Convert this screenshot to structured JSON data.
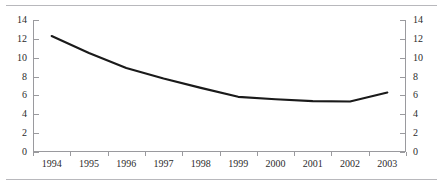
{
  "chart_data": {
    "type": "line",
    "title": "",
    "subtitle": "",
    "xlabel": "",
    "ylabel": "",
    "categories": [
      "1994",
      "1995",
      "1996",
      "1997",
      "1998",
      "1999",
      "2000",
      "2001",
      "2002",
      "2003"
    ],
    "series": [
      {
        "name": "",
        "values": [
          12.3,
          10.5,
          8.9,
          7.8,
          6.8,
          5.85,
          5.6,
          5.4,
          5.35,
          6.3
        ],
        "color": "#1a1a1a",
        "line_width": 2.1
      }
    ],
    "ylim": [
      0,
      14
    ],
    "ytick_step": 2,
    "yticks": [
      0,
      2,
      4,
      6,
      8,
      10,
      12,
      14
    ],
    "ytick_labels_left": [
      "0",
      "2",
      "4",
      "6",
      "8",
      "10",
      "12",
      "14"
    ],
    "ytick_labels_right": [
      "0",
      "2",
      "4",
      "6",
      "8",
      "10",
      "12",
      "14"
    ],
    "dual_axis": true,
    "grid": false,
    "legend": null,
    "legend_position": "none",
    "annotations": [],
    "axis_color": "#9a9a9e",
    "text_color": "#2b2b2b",
    "background": "#ffffff",
    "rule_color": "#b8b8bc"
  }
}
